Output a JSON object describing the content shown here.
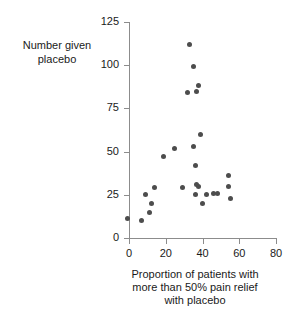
{
  "chart_data": {
    "type": "scatter",
    "title": "",
    "ylabel_lines": [
      "Number given",
      "placebo"
    ],
    "xlabel_lines": [
      "Proportion of patients with",
      "more than 50% pain relief",
      "with placebo"
    ],
    "xlabel": "Proportion of patients with more than 50% pain relief with placebo",
    "ylabel": "Number given placebo",
    "xlim": [
      0,
      80
    ],
    "ylim": [
      0,
      125
    ],
    "xticks": [
      0,
      20,
      40,
      60,
      80
    ],
    "yticks": [
      0,
      25,
      50,
      75,
      100,
      125
    ],
    "xtick_labels": [
      "0",
      "20",
      "40",
      "60",
      "80"
    ],
    "ytick_labels": [
      "0",
      "25",
      "50",
      "75",
      "100",
      "125"
    ],
    "grid": false,
    "legend": "none",
    "marker": "filled-circle",
    "marker_color": "#4d4d4d",
    "axis_color": "#8c8c8c",
    "n_points": 27,
    "points": [
      {
        "x": -1,
        "y": 11
      },
      {
        "x": 7,
        "y": 10
      },
      {
        "x": 9,
        "y": 25
      },
      {
        "x": 11,
        "y": 15
      },
      {
        "x": 12,
        "y": 20
      },
      {
        "x": 14,
        "y": 29
      },
      {
        "x": 19,
        "y": 47
      },
      {
        "x": 25,
        "y": 52
      },
      {
        "x": 29,
        "y": 29
      },
      {
        "x": 33,
        "y": 112
      },
      {
        "x": 35,
        "y": 99
      },
      {
        "x": 36,
        "y": 25
      },
      {
        "x": 32,
        "y": 84
      },
      {
        "x": 37,
        "y": 85
      },
      {
        "x": 38,
        "y": 88
      },
      {
        "x": 35,
        "y": 53
      },
      {
        "x": 36,
        "y": 42
      },
      {
        "x": 37,
        "y": 31
      },
      {
        "x": 38,
        "y": 30
      },
      {
        "x": 39,
        "y": 60
      },
      {
        "x": 40,
        "y": 20
      },
      {
        "x": 42,
        "y": 25
      },
      {
        "x": 46,
        "y": 26
      },
      {
        "x": 48,
        "y": 26
      },
      {
        "x": 54,
        "y": 36
      },
      {
        "x": 54,
        "y": 30
      },
      {
        "x": 55,
        "y": 23
      }
    ]
  }
}
